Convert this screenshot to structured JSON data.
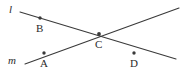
{
  "figure": {
    "kind": "geometry-diagram",
    "background_color": "#ffffff",
    "stroke_color": "#3a3a3a",
    "text_color": "#2b2b2b"
  },
  "lines": [
    {
      "id": "l",
      "label": "l",
      "label_x": 9,
      "label_y": 4,
      "x1": 20,
      "y1": 12,
      "x2": 176,
      "y2": 59,
      "stroke_width": 1.1
    },
    {
      "id": "m",
      "label": "m",
      "label_x": 8,
      "label_y": 55,
      "x1": 25,
      "y1": 64,
      "x2": 179,
      "y2": 8,
      "stroke_width": 1.1
    }
  ],
  "points": [
    {
      "id": "B",
      "label": "B",
      "cx": 40,
      "cy": 18,
      "r": 1.7,
      "label_x": 36,
      "label_y": 23,
      "on_line": "l"
    },
    {
      "id": "A",
      "label": "A",
      "cx": 44,
      "cy": 53,
      "r": 1.7,
      "label_x": 40,
      "label_y": 58,
      "on_line": "m"
    },
    {
      "id": "C",
      "label": "C",
      "cx": 99,
      "cy": 34,
      "r": 1.9,
      "label_x": 95,
      "label_y": 39,
      "on_line": "l,m"
    },
    {
      "id": "D",
      "label": "D",
      "cx": 134,
      "cy": 53,
      "r": 1.7,
      "label_x": 130,
      "label_y": 58,
      "on_line": "none"
    }
  ]
}
